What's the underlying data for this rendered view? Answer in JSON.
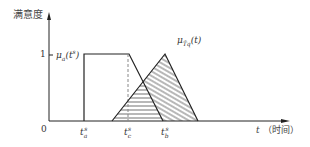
{
  "diagram": {
    "y_axis_label": "满意度",
    "x_axis_label_var": "t",
    "x_axis_label_text": "（时间）",
    "y_tick_one": "1",
    "origin": "0",
    "trapezoid_label": "μ_a(t^s)",
    "trapezoid_label_main": "μ",
    "trapezoid_label_sub": "a",
    "trapezoid_label_arg": "(t",
    "trapezoid_label_sup": "s",
    "trapezoid_label_close": ")",
    "triangle_label_main": "μ",
    "triangle_label_sub": "T̃q",
    "triangle_label_arg": "(t)",
    "x_ticks": [
      {
        "name": "t_a^s",
        "base": "t",
        "sub": "a",
        "sup": "s"
      },
      {
        "name": "t_c^s",
        "base": "t",
        "sub": "c",
        "sup": "s"
      },
      {
        "name": "t_b^s",
        "base": "t",
        "sub": "b",
        "sup": "s"
      }
    ],
    "colors": {
      "line": "#222222",
      "dashed": "#888888",
      "hatch": "#333333",
      "text": "#333333"
    }
  }
}
